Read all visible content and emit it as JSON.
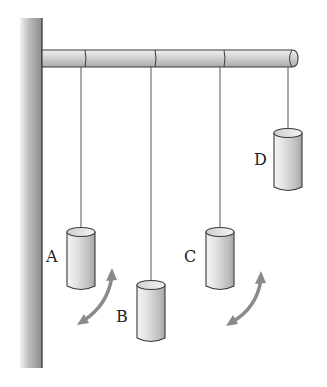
{
  "figure": {
    "colors": {
      "background": "#ffffff",
      "wall": "#9a9a9a",
      "rod": "#c8c8c8",
      "cylinder": "#d6d6d6",
      "string": "#555555",
      "arrow": "#8a8a8a",
      "outline": "#3a3a3a"
    },
    "pendulums": [
      {
        "label": "A",
        "string_x": 81,
        "top": 228,
        "bottom": 290,
        "label_x": 46,
        "label_y": 250
      },
      {
        "label": "B",
        "string_x": 151,
        "top": 281,
        "bottom": 342,
        "label_x": 116,
        "label_y": 310
      },
      {
        "label": "C",
        "string_x": 220,
        "top": 228,
        "bottom": 290,
        "label_x": 184,
        "label_y": 250
      },
      {
        "label": "D",
        "string_x": 288,
        "top": 129,
        "bottom": 191,
        "label_x": 254,
        "label_y": 153
      }
    ],
    "arrows": [
      {
        "name": "swing-arrow-a-b"
      },
      {
        "name": "swing-arrow-c-d"
      }
    ]
  }
}
